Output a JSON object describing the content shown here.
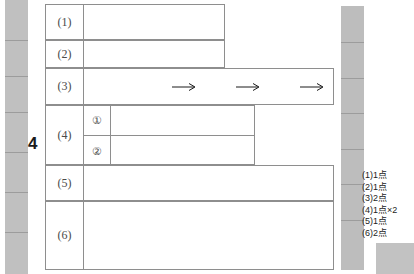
{
  "page": {
    "question_number": "4",
    "background_color": "#ffffff",
    "rule_color": "#8e8e8e",
    "scan_edge_color": "#c0c0c0"
  },
  "answer_sheet": {
    "rows": [
      {
        "label": "(1)",
        "arrows": 0,
        "subrows": []
      },
      {
        "label": "(2)",
        "arrows": 0,
        "subrows": []
      },
      {
        "label": "(3)",
        "arrows": 3,
        "subrows": []
      },
      {
        "label": "(4)",
        "arrows": 0,
        "subrows": [
          "①",
          "②"
        ]
      },
      {
        "label": "(5)",
        "arrows": 0,
        "subrows": []
      },
      {
        "label": "(6)",
        "arrows": 0,
        "subrows": []
      }
    ]
  },
  "score_key": {
    "items": [
      "(1)1点",
      "(2)1点",
      "(3)2点",
      "(4)1点×2",
      "(5)1点",
      "(6)2点"
    ]
  }
}
